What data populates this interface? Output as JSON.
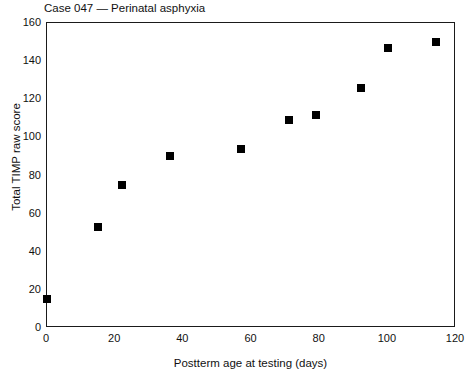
{
  "chart_data": {
    "type": "scatter",
    "title": "Case 047 — Perinatal asphyxia",
    "xlabel": "Postterm age at testing (days)",
    "ylabel": "Total TIMP raw score",
    "xlim": [
      0,
      120
    ],
    "ylim": [
      0,
      160
    ],
    "xticks": [
      0,
      20,
      40,
      60,
      80,
      100,
      120
    ],
    "yticks": [
      0,
      20,
      40,
      60,
      80,
      100,
      120,
      140,
      160
    ],
    "grid": false,
    "legend": null,
    "marker_color": "#000000",
    "marker_shape": "square",
    "x": [
      0,
      15,
      22,
      36,
      57,
      71,
      79,
      92,
      100,
      114
    ],
    "y": [
      15,
      53,
      75,
      90,
      94,
      109,
      112,
      126,
      147,
      150
    ],
    "points": [
      {
        "x": 0,
        "y": 15
      },
      {
        "x": 15,
        "y": 53
      },
      {
        "x": 22,
        "y": 75
      },
      {
        "x": 36,
        "y": 90
      },
      {
        "x": 57,
        "y": 94
      },
      {
        "x": 71,
        "y": 109
      },
      {
        "x": 79,
        "y": 112
      },
      {
        "x": 92,
        "y": 126
      },
      {
        "x": 100,
        "y": 147
      },
      {
        "x": 114,
        "y": 150
      }
    ]
  }
}
